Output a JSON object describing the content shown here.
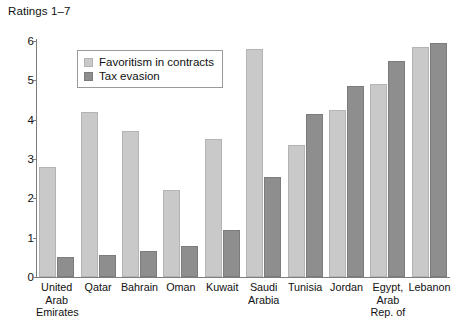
{
  "chart_data": {
    "type": "bar",
    "title": "Ratings 1–7",
    "xlabel": "",
    "ylabel": "",
    "ylim": [
      0,
      6
    ],
    "yticks": [
      0,
      1,
      2,
      3,
      4,
      5,
      6
    ],
    "ytick_labels": [
      "0",
      "1",
      "2",
      "3",
      "4",
      "5",
      "6"
    ],
    "grid": false,
    "legend_position": "top-left-inside",
    "categories": [
      "United Arab Emirates",
      "Qatar",
      "Bahrain",
      "Oman",
      "Kuwait",
      "Saudi Arabia",
      "Tunisia",
      "Jordan",
      "Egypt, Arab Rep. of",
      "Lebanon"
    ],
    "category_label_lines": [
      [
        "United",
        "Arab",
        "Emirates"
      ],
      [
        "Qatar"
      ],
      [
        "Bahrain"
      ],
      [
        "Oman"
      ],
      [
        "Kuwait"
      ],
      [
        "Saudi",
        "Arabia"
      ],
      [
        "Tunisia"
      ],
      [
        "Jordan"
      ],
      [
        "Egypt,",
        "Arab",
        "Rep. of"
      ],
      [
        "Lebanon"
      ]
    ],
    "series": [
      {
        "name": "Favoritism in contracts",
        "color": "#c9c9c9",
        "values": [
          2.8,
          4.2,
          3.7,
          2.2,
          3.5,
          5.8,
          3.35,
          4.25,
          4.9,
          5.85
        ]
      },
      {
        "name": "Tax evasion",
        "color": "#8e8e8e",
        "values": [
          0.5,
          0.55,
          0.65,
          0.78,
          1.2,
          2.55,
          4.15,
          4.85,
          5.5,
          5.95
        ]
      }
    ]
  },
  "legend": {
    "items": [
      {
        "label": "Favoritism in contracts",
        "color": "#c9c9c9"
      },
      {
        "label": "Tax evasion",
        "color": "#8e8e8e"
      }
    ]
  },
  "colors": {
    "series_light": "#c9c9c9",
    "series_dark": "#8e8e8e",
    "axis": "#7d7d7d",
    "text": "#111111",
    "background": "#ffffff"
  }
}
